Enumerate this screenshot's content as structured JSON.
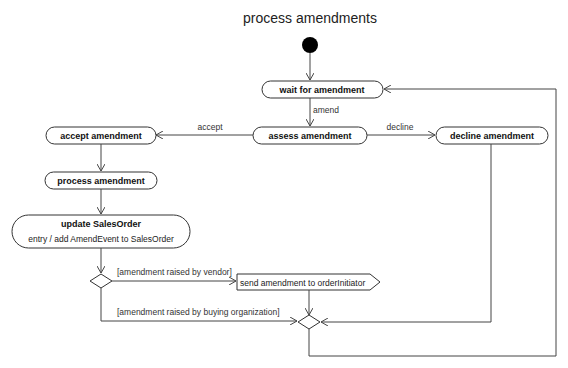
{
  "diagram": {
    "title": "process amendments",
    "type": "UML activity diagram",
    "nodes": {
      "initial": {
        "kind": "initial-node"
      },
      "wait": {
        "label": "wait for amendment"
      },
      "assess": {
        "label": "assess amendment"
      },
      "accept": {
        "label": "accept amendment"
      },
      "decline": {
        "label": "decline amendment"
      },
      "process": {
        "label": "process amendment"
      },
      "update": {
        "label": "update SalesOrder",
        "entry": "entry / add AmendEvent to SalesOrder"
      },
      "decision": {
        "kind": "decision"
      },
      "send": {
        "label": "send amendment to orderInitiator",
        "kind": "send-signal"
      },
      "merge": {
        "kind": "merge"
      }
    },
    "edges": {
      "amend": "amend",
      "accept": "accept",
      "decline": "decline",
      "vendor_guard": "[amendment raised by vendor]",
      "buying_guard": "[amendment raised by buying organization]"
    }
  }
}
